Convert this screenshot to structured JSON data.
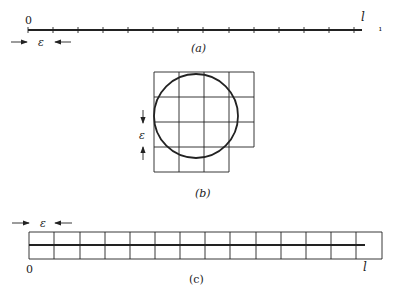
{
  "figure": {
    "panel_a": {
      "label": "(a)",
      "origin_label": "0",
      "end_label": "l",
      "epsilon_label": "ε",
      "tick_count": 14,
      "tick_spacing_px": 25,
      "stray_mark": "ı"
    },
    "panel_b": {
      "label": "(b)",
      "epsilon_label": "ε",
      "grid": {
        "rows": 4,
        "cols": 4,
        "missing_cells": [
          [
            3,
            3
          ]
        ]
      },
      "circle": "inscribed circle spanning grid"
    },
    "panel_c": {
      "label": "(c)",
      "origin_label": "0",
      "end_label": "l",
      "epsilon_label": "ε",
      "grid": {
        "rows": 2,
        "cols": 14
      }
    },
    "colors": {
      "ink": "#222222",
      "background": "#ffffff"
    }
  }
}
